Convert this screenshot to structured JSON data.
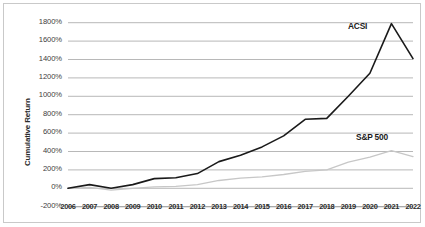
{
  "chart_data": {
    "type": "line",
    "title": "",
    "xlabel": "",
    "ylabel": "Cumulative Return",
    "x": [
      2006,
      2007,
      2008,
      2009,
      2010,
      2011,
      2012,
      2013,
      2014,
      2015,
      2016,
      2017,
      2018,
      2019,
      2020,
      2021,
      2022
    ],
    "xtick_labels": [
      "2006",
      "2007",
      "2008",
      "2009",
      "2010",
      "2011",
      "2012",
      "2013",
      "2014",
      "2015",
      "2016",
      "2017",
      "2018",
      "2019",
      "2020",
      "2021",
      "2022"
    ],
    "ylim": [
      -200,
      1800
    ],
    "ytick_values": [
      1800,
      1600,
      1400,
      1200,
      1000,
      800,
      600,
      400,
      200,
      0,
      -200
    ],
    "ytick_labels": [
      "1800%",
      "1600%",
      "1400%",
      "1200%",
      "1000%",
      "800%",
      "600%",
      "400%",
      "200%",
      "0%",
      "-200%"
    ],
    "grid": true,
    "legend": "inline-labels",
    "series": [
      {
        "name": "ACSI",
        "color": "#1a1a1a",
        "label_position": "upper-right",
        "values": [
          0,
          40,
          0,
          40,
          105,
          115,
          160,
          290,
          360,
          450,
          570,
          750,
          760,
          1000,
          1250,
          1790,
          1410
        ]
      },
      {
        "name": "S&P 500",
        "color": "#c7c7c7",
        "label_position": "lower-right",
        "values": [
          0,
          10,
          -20,
          0,
          15,
          20,
          40,
          85,
          110,
          125,
          150,
          185,
          200,
          285,
          340,
          410,
          345
        ]
      }
    ]
  }
}
